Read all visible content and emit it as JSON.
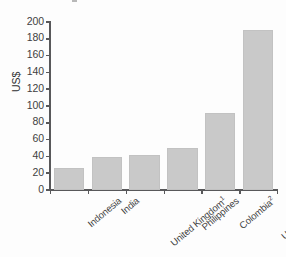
{
  "chart_data": {
    "type": "bar",
    "title": "",
    "subtitle": "",
    "xlabel": "",
    "ylabel": "US$",
    "ylim": [
      0,
      200
    ],
    "ytick_step": 20,
    "grid": false,
    "legend": null,
    "orientation": "vertical",
    "categories": [
      "Indonesia",
      "India",
      "United Kingdom",
      "Philippines",
      "Colombia",
      "United States"
    ],
    "category_footnotes": [
      "",
      "",
      "1",
      "",
      "2",
      "3"
    ],
    "values": [
      26,
      39,
      42,
      50,
      92,
      190
    ],
    "ytick_labels": [
      "0",
      "20",
      "40",
      "60",
      "80",
      "100",
      "120",
      "140",
      "160",
      "180",
      "200"
    ],
    "ytick_values": [
      0,
      20,
      40,
      60,
      80,
      100,
      120,
      140,
      160,
      180,
      200
    ],
    "colors": {
      "bar_fill": "#c9c9c9",
      "bar_stroke": "#c2c2c2",
      "axis": "#58585a",
      "text": "#3f3f41",
      "background": "#fdfdfd"
    }
  }
}
